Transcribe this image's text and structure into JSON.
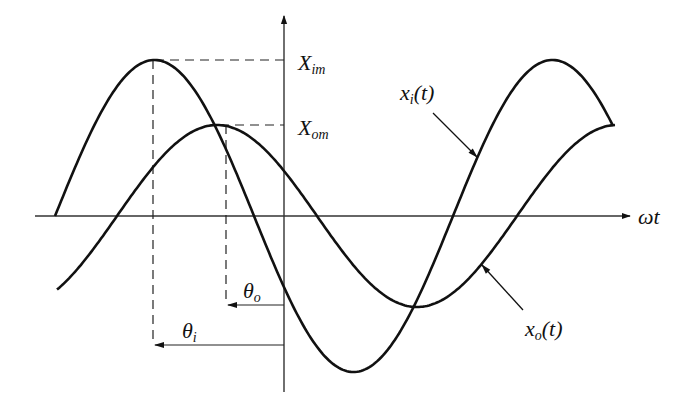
{
  "labels": {
    "x_axis": "ωt",
    "x_im_main": "X",
    "x_im_sub": "im",
    "x_om_main": "X",
    "x_om_sub": "om",
    "theta_i_main": "θ",
    "theta_i_sub": "i",
    "theta_o_main": "θ",
    "theta_o_sub": "o",
    "xi_main": "x",
    "xi_sub": "i",
    "xi_arg": "(t)",
    "xo_main": "x",
    "xo_sub": "o",
    "xo_arg": "(t)"
  },
  "curves": {
    "input": {
      "name": "x_i(t)",
      "amplitude_px": 156,
      "period_px": 398,
      "zero_up_x": 55
    },
    "output": {
      "name": "x_o(t)",
      "amplitude_px": 91,
      "period_px": 400,
      "zero_up_x": 117
    }
  },
  "colors": {
    "ink": "#111111",
    "axis": "#333333"
  }
}
